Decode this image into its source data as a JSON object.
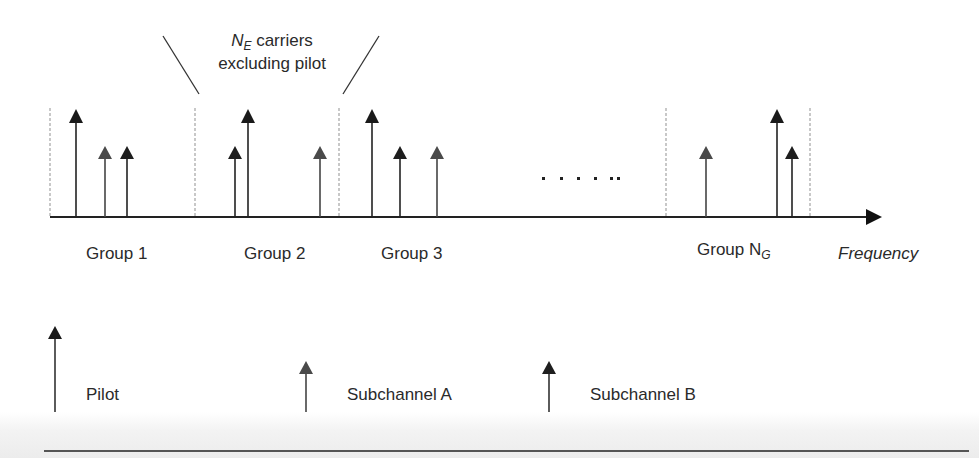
{
  "header": {
    "symbol": "N",
    "subscript": "E",
    "line1_rest": " carriers",
    "line2": "excluding pilot"
  },
  "axis": {
    "label": "Frequency",
    "ellipsis": "· · · · · ··"
  },
  "groups": [
    {
      "label": "Group 1",
      "subscript": ""
    },
    {
      "label": "Group 2",
      "subscript": ""
    },
    {
      "label": "Group 3",
      "subscript": ""
    },
    {
      "label": "Group N",
      "subscript": "G"
    }
  ],
  "legend": {
    "pilot": "Pilot",
    "subchannel_a": "Subchannel A",
    "subchannel_b": "Subchannel B"
  },
  "colors": {
    "pilot": "#1a1a1a",
    "subchannel_a": "#4a4a4a",
    "subchannel_b": "#1e1e1e",
    "separator": "#c8c8c8",
    "axis": "#222222"
  },
  "carriers": [
    {
      "group": 1,
      "type": "pilot"
    },
    {
      "group": 1,
      "type": "subchannel_a"
    },
    {
      "group": 1,
      "type": "subchannel_b"
    },
    {
      "group": 2,
      "type": "subchannel_b"
    },
    {
      "group": 2,
      "type": "pilot"
    },
    {
      "group": 2,
      "type": "subchannel_a"
    },
    {
      "group": 3,
      "type": "pilot"
    },
    {
      "group": 3,
      "type": "subchannel_b"
    },
    {
      "group": 3,
      "type": "subchannel_a"
    },
    {
      "group": "N_G",
      "type": "subchannel_a"
    },
    {
      "group": "N_G",
      "type": "pilot"
    },
    {
      "group": "N_G",
      "type": "subchannel_b"
    }
  ]
}
